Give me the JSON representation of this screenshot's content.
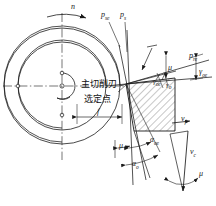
{
  "figure": {
    "bg_color": "#ffffff",
    "line_color": "#1a1a1a",
    "hatch_color": "#333333"
  },
  "labels": {
    "rotation": {
      "symbol": "n",
      "sub": "",
      "desc": "spindle-rotation-direction"
    },
    "plane_se": {
      "symbol": "p",
      "sub": "se",
      "desc": "working-cutting-plane"
    },
    "plane_s": {
      "symbol": "p",
      "sub": "s",
      "desc": "tool-cutting-plane"
    },
    "plane_re": {
      "symbol": "p",
      "sub": "re",
      "desc": "working-reference-plane"
    },
    "gamma_oe": {
      "symbol": "γ",
      "sub": "oe",
      "desc": "working-rake-angle"
    },
    "gamma_o": {
      "symbol": "γ",
      "sub": "o",
      "desc": "tool-rake-angle"
    },
    "alpha_oe": {
      "symbol": "α",
      "sub": "oe",
      "desc": "working-clearance-angle"
    },
    "alpha_o": {
      "symbol": "α",
      "sub": "o",
      "desc": "tool-clearance-angle"
    },
    "mu_top": {
      "symbol": "μ",
      "sub": "",
      "desc": "feed-motion-angle-top"
    },
    "mu_wedge": {
      "symbol": "μ",
      "sub": "",
      "desc": "feed-motion-angle-wedge"
    },
    "mu_bottom_left": {
      "symbol": "μ",
      "sub": "",
      "desc": "feed-motion-angle-lower"
    },
    "mu_bottom_right": {
      "symbol": "μ",
      "sub": "",
      "desc": "feed-motion-angle-velocity"
    },
    "v_c": {
      "symbol": "v",
      "sub": "c",
      "desc": "cutting-speed-vector"
    },
    "v_f": {
      "symbol": "v",
      "sub": "f",
      "desc": "feed-speed-vector"
    },
    "feed": {
      "symbol": "f",
      "sub": "",
      "desc": "feed-per-revolution"
    }
  },
  "annotations": {
    "main_cutting_edge": "主切削刃",
    "selected_point": "选定点"
  },
  "geometry": {
    "workpiece_center": {
      "x": 62,
      "y": 86
    },
    "outer_radius": 58,
    "mid_radius": 44,
    "hub_radius": 13,
    "tool_point": {
      "x": 126,
      "y": 84
    }
  }
}
